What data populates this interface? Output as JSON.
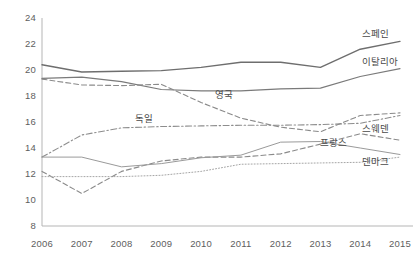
{
  "chart_data": {
    "type": "line",
    "title": "",
    "subtitle": "",
    "xlabel": "",
    "ylabel": "",
    "x": [
      2006,
      2007,
      2008,
      2009,
      2010,
      2011,
      2012,
      2013,
      2014,
      2015
    ],
    "xtick_labels": [
      "2006",
      "2007",
      "2008",
      "2009",
      "2010",
      "2011",
      "2012",
      "2013",
      "2014",
      "2015"
    ],
    "ytick_labels": [
      "8",
      "10",
      "12",
      "14",
      "16",
      "18",
      "20",
      "22",
      "24"
    ],
    "yticks": [
      8,
      10,
      12,
      14,
      16,
      18,
      20,
      22,
      24
    ],
    "ylim": [
      8,
      24
    ],
    "xlim": [
      2006,
      2015
    ],
    "grid": false,
    "legend_position": "inline-right",
    "series": [
      {
        "name": "스페인",
        "style": "solid",
        "color": "#6e6e6e",
        "width": 1.4,
        "label_x": 2014.05,
        "label_y": 22.95,
        "values": [
          20.4,
          19.85,
          19.9,
          19.95,
          20.2,
          20.6,
          20.6,
          20.2,
          21.6,
          22.2
        ]
      },
      {
        "name": "이탈리아",
        "style": "solid",
        "color": "#7a7a7a",
        "width": 1.2,
        "label_x": 2014.05,
        "label_y": 20.75,
        "values": [
          19.35,
          19.45,
          19.1,
          18.5,
          18.4,
          18.4,
          18.55,
          18.6,
          19.5,
          20.1
        ]
      },
      {
        "name": "영국",
        "style": "dashed",
        "color": "#8a8a8a",
        "width": 1.1,
        "label_x": 2010.35,
        "label_y": 18.25,
        "values": [
          19.3,
          18.85,
          18.8,
          18.9,
          17.5,
          16.3,
          15.6,
          15.25,
          16.5,
          16.7
        ]
      },
      {
        "name": "독일",
        "style": "dashed",
        "color": "#8a8a8a",
        "width": 1.1,
        "label_x": 2008.35,
        "label_y": 16.35,
        "values": [
          12.2,
          10.5,
          12.2,
          13.0,
          13.3,
          13.3,
          13.55,
          14.3,
          15.1,
          14.6
        ]
      },
      {
        "name": "스웨덴",
        "style": "dashdot",
        "color": "#8d8d8d",
        "width": 1.1,
        "label_x": 2014.05,
        "label_y": 15.65,
        "values": [
          13.3,
          15.0,
          15.55,
          15.65,
          15.7,
          15.75,
          15.75,
          15.8,
          15.9,
          16.5
        ]
      },
      {
        "name": "프랑스",
        "style": "solid",
        "color": "#9a9a9a",
        "width": 1.0,
        "label_x": 2013.0,
        "label_y": 14.55,
        "values": [
          13.3,
          13.3,
          12.55,
          12.8,
          13.25,
          13.45,
          14.45,
          14.5,
          14.0,
          13.5
        ]
      },
      {
        "name": "덴마크",
        "style": "dotted",
        "color": "#a5a5a5",
        "width": 1.0,
        "label_x": 2014.05,
        "label_y": 13.05,
        "values": [
          11.8,
          11.8,
          11.8,
          11.9,
          12.2,
          12.75,
          12.8,
          12.85,
          12.9,
          13.3
        ]
      }
    ]
  },
  "axes": {
    "axis_color": "#b5b5b5",
    "plot_left": 42,
    "plot_right": 400,
    "plot_top": 18,
    "plot_bottom": 226,
    "y_min": 8,
    "y_max": 24
  }
}
